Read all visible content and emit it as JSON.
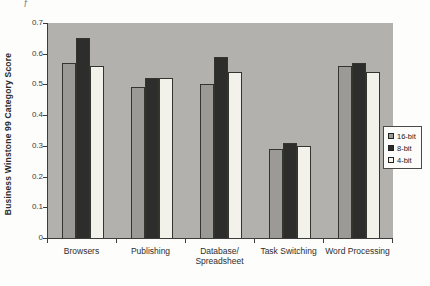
{
  "page": {
    "artifact_mark": "f"
  },
  "chart_data": {
    "type": "bar",
    "title": "",
    "xlabel": "",
    "ylabel": "Business Winstone 99 Category Score",
    "ylim": [
      0,
      0.7
    ],
    "y_ticks": [
      0,
      0.1,
      0.2,
      0.3,
      0.4,
      0.5,
      0.6,
      0.7
    ],
    "y_tick_labels": [
      "0",
      "0.1",
      "0.2",
      "0.3",
      "0.4",
      "0.5",
      "0.6",
      "0.7"
    ],
    "categories": [
      "Browsers",
      "Publishing",
      "Database/Spreadsheet",
      "Task Switching",
      "Word Processing"
    ],
    "series": [
      {
        "name": "16-bit",
        "color": "#9b9a96",
        "values": [
          0.57,
          0.49,
          0.5,
          0.29,
          0.56
        ]
      },
      {
        "name": "8-bit",
        "color": "#2d2d2b",
        "values": [
          0.65,
          0.52,
          0.59,
          0.31,
          0.57
        ]
      },
      {
        "name": "4-bit",
        "color": "#f2f1ea",
        "values": [
          0.56,
          0.52,
          0.54,
          0.3,
          0.54
        ]
      }
    ],
    "legend_position": "right",
    "legend_labels": [
      "16-bit",
      "8-bit",
      "4-bit"
    ],
    "plot_background": "#b2b1ad",
    "grid": false
  }
}
